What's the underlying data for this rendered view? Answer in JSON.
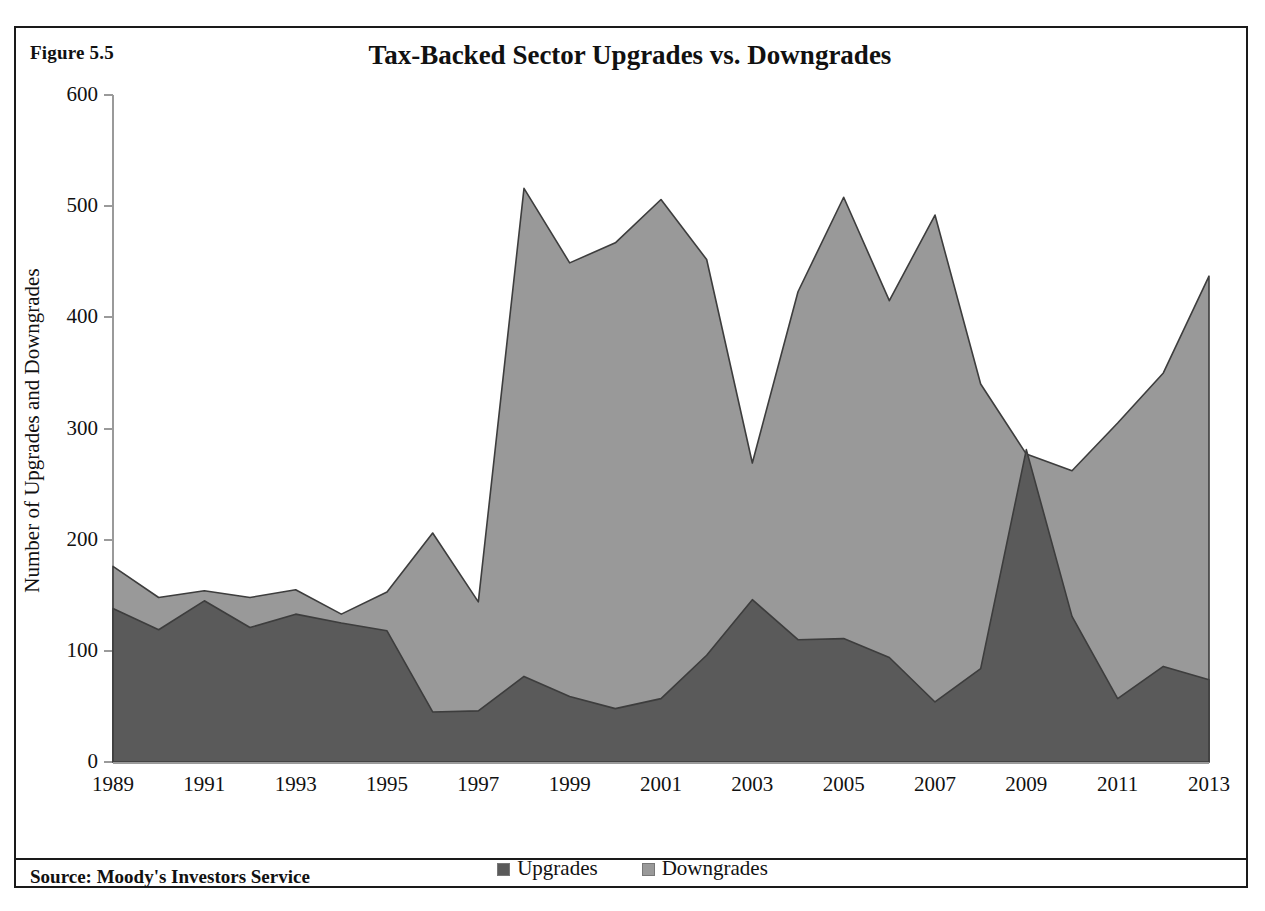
{
  "figure": {
    "label": "Figure 5.5"
  },
  "source": {
    "text": "Source: Moody's Investors Service"
  },
  "legend": {
    "position": "bottom",
    "entries": [
      {
        "label": "Upgrades",
        "color": "#5a5a5a",
        "icon": "legend-swatch-icon"
      },
      {
        "label": "Downgrades",
        "color": "#999999",
        "icon": "legend-swatch-icon"
      }
    ]
  },
  "colors": {
    "upgrades": "#5a5a5a",
    "downgrades": "#999999",
    "axis": "#9a9a9a",
    "frame": "#1a1a1a",
    "text": "#111111"
  },
  "chart_data": {
    "type": "area",
    "title": "Tax-Backed Sector Upgrades vs. Downgrades",
    "xlabel": "",
    "ylabel": "Number of Upgrades and Downgrades",
    "ylim": [
      0,
      600
    ],
    "yticks": [
      0,
      100,
      200,
      300,
      400,
      500,
      600
    ],
    "ytick_labels": [
      "0",
      "100",
      "200",
      "300",
      "400",
      "500",
      "600"
    ],
    "xlim": [
      1989,
      2013
    ],
    "x": [
      1989,
      1990,
      1991,
      1992,
      1993,
      1994,
      1995,
      1996,
      1997,
      1998,
      1999,
      2000,
      2001,
      2002,
      2003,
      2004,
      2005,
      2006,
      2007,
      2008,
      2009,
      2010,
      2011,
      2012,
      2013
    ],
    "xtick_labels": [
      "1989",
      "1991",
      "1993",
      "1995",
      "1997",
      "1999",
      "2001",
      "2003",
      "2005",
      "2007",
      "2009",
      "2011",
      "2013"
    ],
    "xticks": [
      1989,
      1991,
      1993,
      1995,
      1997,
      1999,
      2001,
      2003,
      2005,
      2007,
      2009,
      2011,
      2013
    ],
    "grid": false,
    "overlap": true,
    "series": [
      {
        "name": "Downgrades",
        "color": "#999999",
        "values": [
          176,
          148,
          154,
          148,
          155,
          133,
          153,
          206,
          144,
          516,
          449,
          467,
          506,
          452,
          269,
          423,
          508,
          415,
          492,
          340,
          277,
          262,
          305,
          350,
          437
        ]
      },
      {
        "name": "Upgrades",
        "color": "#5a5a5a",
        "values": [
          138,
          119,
          145,
          121,
          133,
          125,
          118,
          45,
          46,
          77,
          59,
          48,
          57,
          96,
          146,
          110,
          111,
          94,
          54,
          84,
          281,
          131,
          57,
          86,
          74
        ]
      }
    ]
  }
}
